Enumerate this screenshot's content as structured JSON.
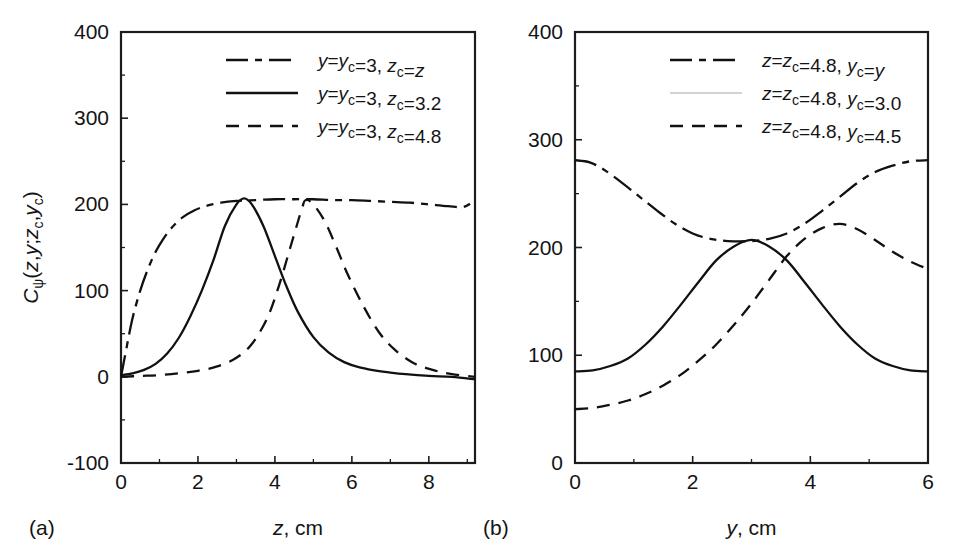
{
  "figure": {
    "panels": [
      {
        "tag": "(a)",
        "xlabel_main": "z",
        "xlabel_unit": ", cm",
        "ylabel": "C_psi(z,y;z_c,y_c)",
        "xticks": [
          "0",
          "2",
          "4",
          "6",
          "8"
        ],
        "yticks": [
          "400",
          "300",
          "200",
          "100",
          "0",
          "-100"
        ],
        "legend": [
          {
            "style": "dashdot",
            "parts": [
              "y",
              "=",
              "y",
              "c",
              "=3, ",
              "z",
              "c",
              "=",
              "z"
            ]
          },
          {
            "style": "solid",
            "parts": [
              "y",
              "=",
              "y",
              "c",
              "=3, ",
              "z",
              "c",
              "=3.2"
            ]
          },
          {
            "style": "dashed",
            "parts": [
              "y",
              "=",
              "y",
              "c",
              "=3, ",
              "z",
              "c",
              "=4.8"
            ]
          }
        ]
      },
      {
        "tag": "(b)",
        "xlabel_main": "y",
        "xlabel_unit": ", cm",
        "xticks": [
          "0",
          "2",
          "4",
          "6"
        ],
        "yticks": [
          "400",
          "300",
          "200",
          "100",
          "0"
        ],
        "legend": [
          {
            "style": "dashdot",
            "parts": [
              "z",
              "=",
              "z",
              "c",
              "=4.8, ",
              "y",
              "c",
              "=",
              "y"
            ]
          },
          {
            "style": "faint",
            "parts": [
              "z",
              "=",
              "z",
              "c",
              "=4.8, ",
              "y",
              "c",
              "=3.0"
            ]
          },
          {
            "style": "dashed",
            "parts": [
              "z",
              "=",
              "z",
              "c",
              "=4.8, ",
              "y",
              "c",
              "=4.5"
            ]
          }
        ]
      }
    ]
  },
  "chart_data": [
    {
      "type": "line",
      "panel": "(a)",
      "title": "",
      "xlabel": "z, cm",
      "ylabel": "C_psi(z,y;z_c,y_c)",
      "xlim": [
        0,
        9.2
      ],
      "ylim": [
        -100,
        400
      ],
      "xticks": [
        0,
        2,
        4,
        6,
        8
      ],
      "yticks": [
        -100,
        0,
        100,
        200,
        300,
        400
      ],
      "grid": false,
      "legend_position": "top-right",
      "series": [
        {
          "name": "y=y_c=3, z_c=z",
          "style": "dash-dot",
          "x": [
            0,
            0.15,
            0.3,
            0.5,
            0.7,
            0.9,
            1.1,
            1.3,
            1.6,
            1.9,
            2.2,
            2.6,
            3.0,
            3.5,
            4.0,
            4.5,
            5.0,
            5.5,
            6.0,
            6.5,
            7.0,
            7.5,
            8.0,
            8.5,
            8.9,
            9.2
          ],
          "y": [
            0,
            35,
            68,
            100,
            125,
            145,
            160,
            172,
            185,
            193,
            198,
            202,
            204,
            205,
            206,
            206,
            206,
            205,
            205,
            204,
            203,
            202,
            200,
            198,
            197,
            205
          ]
        },
        {
          "name": "y=y_c=3, z_c=3.2",
          "style": "solid",
          "x": [
            0,
            0.3,
            0.6,
            0.9,
            1.2,
            1.5,
            1.8,
            2.1,
            2.4,
            2.7,
            3.0,
            3.2,
            3.4,
            3.7,
            4.0,
            4.3,
            4.6,
            5.0,
            5.4,
            5.8,
            6.2,
            6.8,
            7.4,
            8.0,
            8.6,
            9.2
          ],
          "y": [
            2,
            4,
            8,
            15,
            27,
            45,
            70,
            100,
            135,
            175,
            200,
            207,
            200,
            175,
            140,
            105,
            75,
            46,
            28,
            17,
            11,
            6,
            3,
            1,
            0,
            -3
          ]
        },
        {
          "name": "y=y_c=3, z_c=4.8",
          "style": "dashed",
          "x": [
            0,
            0.5,
            1.0,
            1.5,
            2.0,
            2.5,
            3.0,
            3.4,
            3.8,
            4.1,
            4.4,
            4.7,
            4.8,
            5.0,
            5.3,
            5.6,
            5.9,
            6.3,
            6.7,
            7.1,
            7.6,
            8.1,
            8.6,
            9.2
          ],
          "y": [
            0,
            1,
            2,
            4,
            7,
            12,
            22,
            38,
            68,
            105,
            150,
            195,
            205,
            200,
            180,
            150,
            118,
            82,
            52,
            32,
            16,
            8,
            3,
            0
          ]
        }
      ]
    },
    {
      "type": "line",
      "panel": "(b)",
      "title": "",
      "xlabel": "y, cm",
      "ylabel": "",
      "xlim": [
        0,
        6
      ],
      "ylim": [
        0,
        400
      ],
      "xticks": [
        0,
        2,
        4,
        6
      ],
      "yticks": [
        0,
        100,
        200,
        300,
        400
      ],
      "grid": false,
      "legend_position": "top-right",
      "series": [
        {
          "name": "z=z_c=4.8, y_c=y",
          "style": "dash-dot",
          "x": [
            0,
            0.25,
            0.5,
            0.8,
            1.1,
            1.4,
            1.7,
            2.0,
            2.3,
            2.6,
            3.0,
            3.3,
            3.6,
            3.9,
            4.2,
            4.5,
            4.8,
            5.1,
            5.4,
            5.7,
            6.0
          ],
          "y": [
            281,
            279,
            272,
            260,
            247,
            234,
            222,
            213,
            208,
            206,
            206,
            208,
            213,
            222,
            234,
            247,
            260,
            270,
            276,
            280,
            281
          ]
        },
        {
          "name": "z=z_c=4.8, y_c=3.0",
          "style": "solid",
          "x": [
            0,
            0.3,
            0.6,
            0.9,
            1.2,
            1.5,
            1.8,
            2.1,
            2.4,
            2.7,
            3.0,
            3.3,
            3.6,
            3.9,
            4.2,
            4.5,
            4.8,
            5.1,
            5.4,
            5.7,
            6.0
          ],
          "y": [
            85,
            86,
            90,
            97,
            110,
            127,
            147,
            168,
            188,
            201,
            207,
            201,
            188,
            168,
            147,
            127,
            110,
            97,
            90,
            86,
            85
          ]
        },
        {
          "name": "z=z_c=4.8, y_c=4.5",
          "style": "dashed",
          "x": [
            0,
            0.3,
            0.6,
            0.9,
            1.2,
            1.5,
            1.8,
            2.1,
            2.4,
            2.7,
            3.0,
            3.3,
            3.6,
            3.9,
            4.2,
            4.5,
            4.8,
            5.1,
            5.4,
            5.7,
            6.0
          ],
          "y": [
            50,
            51,
            54,
            58,
            64,
            72,
            82,
            95,
            110,
            128,
            148,
            170,
            192,
            208,
            218,
            222,
            217,
            207,
            196,
            187,
            180
          ]
        }
      ]
    }
  ]
}
